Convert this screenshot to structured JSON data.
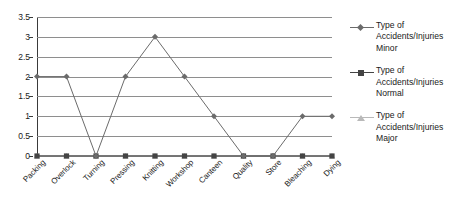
{
  "chart_data": {
    "type": "line",
    "title": "",
    "xlabel": "",
    "ylabel": "",
    "ylim": [
      0,
      3.5
    ],
    "yticks": [
      "0",
      "0.5",
      "1",
      "1.5",
      "2",
      "2.5",
      "3",
      "3.5"
    ],
    "ytick_values": [
      0,
      0.5,
      1,
      1.5,
      2,
      2.5,
      3,
      3.5
    ],
    "grid": true,
    "legend_position": "right",
    "categories": [
      "Packing",
      "Overlock",
      "Turning",
      "Pressing",
      "Knitting",
      "Workshop",
      "Canteen",
      "Quality",
      "Store",
      "Bleaching",
      "Dying"
    ],
    "series": [
      {
        "name": "Type of Accidents/Injuries Minor",
        "marker": "diamond",
        "color": "#6b6b6b",
        "values": [
          2,
          2,
          0,
          2,
          3,
          2,
          1,
          0,
          0,
          1,
          1
        ]
      },
      {
        "name": "Type of Accidents/Injuries Normal",
        "marker": "square",
        "color": "#444444",
        "values": [
          0,
          0,
          0,
          0,
          0,
          0,
          0,
          0,
          0,
          0,
          0
        ]
      },
      {
        "name": "Type of Accidents/Injuries Major",
        "marker": "triangle",
        "color": "#b9b9b9",
        "values": [
          0,
          0,
          0,
          0,
          0,
          0,
          0,
          0,
          0,
          0,
          0
        ]
      }
    ]
  },
  "legend": {
    "entries": [
      {
        "line1": "Type of",
        "line2": "Accidents/Injuries",
        "line3": "Minor"
      },
      {
        "line1": "Type of",
        "line2": "Accidents/Injuries",
        "line3": "Normal"
      },
      {
        "line1": "Type of",
        "line2": "Accidents/Injuries",
        "line3": "Major"
      }
    ]
  },
  "colors": {
    "minor": "#6b6b6b",
    "normal": "#444444",
    "major": "#b9b9b9",
    "grid": "#8e8e8e",
    "axis": "#3a3a3a",
    "background": "#ffffff"
  }
}
